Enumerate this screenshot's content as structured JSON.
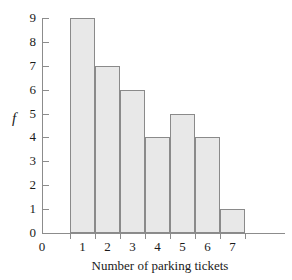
{
  "chart_data": {
    "type": "bar",
    "title": "",
    "subtitle": "",
    "xlabel": "Number of parking tickets",
    "ylabel": "f",
    "categories": [
      "1",
      "2",
      "3",
      "4",
      "5",
      "6",
      "7"
    ],
    "values": [
      9,
      7,
      6,
      4,
      5,
      4,
      1
    ],
    "series": [
      {
        "name": "f",
        "values": [
          9,
          7,
          6,
          4,
          5,
          4,
          1
        ]
      }
    ],
    "xlim": [
      0,
      7
    ],
    "ylim": [
      0,
      9
    ],
    "x_tick_labels": [
      "0",
      "1",
      "2",
      "3",
      "4",
      "5",
      "6",
      "7"
    ],
    "y_tick_labels": [
      "0",
      "1",
      "2",
      "3",
      "4",
      "5",
      "6",
      "7",
      "8",
      "9"
    ],
    "y_tick_values": [
      0,
      1,
      2,
      3,
      4,
      5,
      6,
      7,
      8,
      9
    ],
    "grid": false,
    "legend": false,
    "legend_position": "none",
    "annotations": [],
    "bar_fill_color": "#e8e8e8",
    "bar_border_color": "#8a8a8a",
    "axis_color": "#8c8c8c",
    "text_color": "#1a1a1a",
    "background_color": "#ffffff"
  }
}
